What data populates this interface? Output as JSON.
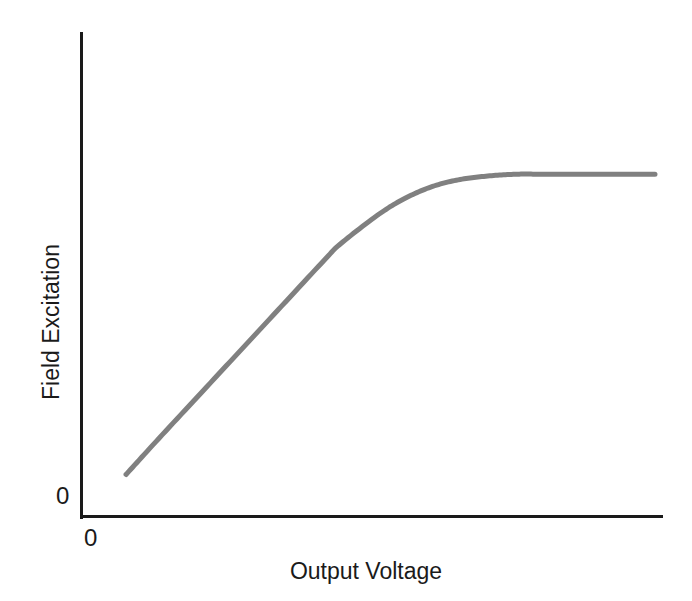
{
  "chart_data": {
    "type": "line",
    "title": "",
    "subtitle": "",
    "xlabel": "Output Voltage",
    "ylabel": "Field Excitation",
    "x_tick_labels": [
      "0"
    ],
    "y_tick_labels": [
      "0"
    ],
    "grid": false,
    "legend": null,
    "legend_position": "none",
    "xlim": [
      0,
      100
    ],
    "ylim": [
      0,
      100
    ],
    "annotations": [],
    "series": [
      {
        "name": "Field excitation characteristic",
        "color": "#808080",
        "line_width_px": 5,
        "x": [
          4,
          10,
          20,
          30,
          40,
          43,
          50,
          55,
          60,
          65,
          70,
          75,
          80,
          90,
          100
        ],
        "y": [
          5,
          16,
          34,
          52,
          70,
          75,
          84,
          89,
          92.5,
          94.5,
          95.5,
          96,
          96,
          96,
          96
        ]
      }
    ]
  },
  "axes": {
    "y_origin_label": "0",
    "x_origin_label": "0",
    "axis_color": "#1a1a1a"
  },
  "labels": {
    "y_axis_title": "Field Excitation",
    "x_axis_title": "Output Voltage"
  }
}
